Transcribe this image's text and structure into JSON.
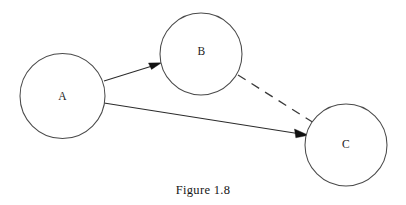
{
  "figure": {
    "caption": "Figure 1.8",
    "background_color": "#ffffff",
    "stroke_color": "#3a3a3a",
    "text_color": "#161616"
  },
  "diagram": {
    "type": "node-link-diagram",
    "nodes": [
      {
        "id": "A",
        "label": "A",
        "cx": 62,
        "cy": 96,
        "r": 42
      },
      {
        "id": "B",
        "label": "B",
        "cx": 201,
        "cy": 54,
        "r": 41
      },
      {
        "id": "C",
        "label": "C",
        "cx": 346,
        "cy": 145,
        "r": 41
      }
    ],
    "edges": [
      {
        "id": "a-to-b",
        "from": "A",
        "to": "B",
        "style": "solid",
        "directed": true,
        "x1": 104,
        "y1": 81,
        "x2": 161,
        "y2": 63
      },
      {
        "id": "a-to-c",
        "from": "A",
        "to": "C",
        "style": "solid",
        "directed": true,
        "x1": 104,
        "y1": 103,
        "x2": 308,
        "y2": 135
      },
      {
        "id": "b-to-c",
        "from": "B",
        "to": "C",
        "style": "dashed",
        "directed": false,
        "x1": 238,
        "y1": 76,
        "x2": 313,
        "y2": 123
      }
    ]
  }
}
